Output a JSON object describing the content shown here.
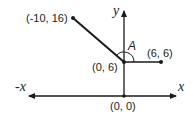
{
  "diagram": {
    "type": "coordinate-angle-diagram",
    "axes": {
      "x_label": "x",
      "neg_x_label": "-x",
      "y_label": "y",
      "origin_label": "(0, 0)"
    },
    "points": [
      {
        "id": "P1",
        "label": "(-10, 16)",
        "x": -10,
        "y": 16
      },
      {
        "id": "V",
        "label": "(0, 6)",
        "x": 0,
        "y": 6
      },
      {
        "id": "P2",
        "label": "(6, 6)",
        "x": 6,
        "y": 6
      },
      {
        "id": "O",
        "label": "(0, 0)",
        "x": 0,
        "y": 0
      }
    ],
    "segments": [
      {
        "from": "V",
        "to": "P1"
      },
      {
        "from": "V",
        "to": "P2"
      }
    ],
    "angle": {
      "label": "A",
      "vertex": "V",
      "between": [
        "P1",
        "P2"
      ]
    },
    "colors": {
      "stroke": "#1a1a1a",
      "text": "#222222",
      "background": "#ffffff"
    }
  }
}
